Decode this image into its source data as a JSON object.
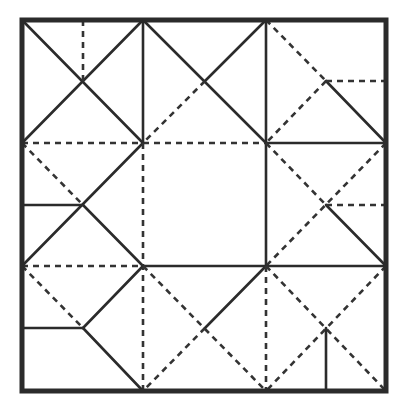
{
  "diagram": {
    "title": "",
    "colors": {
      "line": "#2b2b2b",
      "background": "#ffffff"
    },
    "border": {
      "x1": 22,
      "y1": 20,
      "x2": 386,
      "y2": 391
    },
    "grid": {
      "xs": [
        22,
        143,
        266,
        386
      ],
      "ys": [
        20,
        143,
        266,
        391
      ],
      "mid_xs": [
        83,
        205,
        326
      ],
      "mid_ys": [
        81,
        205,
        328
      ]
    },
    "lines": [
      {
        "type": "solid",
        "x1": 22,
        "y1": 20,
        "x2": 143,
        "y2": 143
      },
      {
        "type": "solid",
        "x1": 143,
        "y1": 20,
        "x2": 22,
        "y2": 143
      },
      {
        "type": "dashed",
        "x1": 83,
        "y1": 20,
        "x2": 83,
        "y2": 81
      },
      {
        "type": "solid",
        "x1": 143,
        "y1": 20,
        "x2": 143,
        "y2": 143
      },
      {
        "type": "solid",
        "x1": 143,
        "y1": 20,
        "x2": 266,
        "y2": 143
      },
      {
        "type": "solid",
        "x1": 266,
        "y1": 20,
        "x2": 205,
        "y2": 81
      },
      {
        "type": "dashed",
        "x1": 205,
        "y1": 81,
        "x2": 143,
        "y2": 143
      },
      {
        "type": "solid",
        "x1": 266,
        "y1": 20,
        "x2": 266,
        "y2": 266
      },
      {
        "type": "dashed",
        "x1": 266,
        "y1": 20,
        "x2": 326,
        "y2": 81
      },
      {
        "type": "solid",
        "x1": 326,
        "y1": 81,
        "x2": 386,
        "y2": 143
      },
      {
        "type": "dashed",
        "x1": 326,
        "y1": 81,
        "x2": 266,
        "y2": 143
      },
      {
        "type": "dashed",
        "x1": 326,
        "y1": 81,
        "x2": 386,
        "y2": 81
      },
      {
        "type": "dashed",
        "x1": 22,
        "y1": 143,
        "x2": 266,
        "y2": 143
      },
      {
        "type": "solid",
        "x1": 266,
        "y1": 143,
        "x2": 386,
        "y2": 143
      },
      {
        "type": "dashed",
        "x1": 22,
        "y1": 143,
        "x2": 83,
        "y2": 205
      },
      {
        "type": "solid",
        "x1": 143,
        "y1": 143,
        "x2": 22,
        "y2": 266
      },
      {
        "type": "solid",
        "x1": 83,
        "y1": 205,
        "x2": 143,
        "y2": 266
      },
      {
        "type": "solid",
        "x1": 22,
        "y1": 205,
        "x2": 83,
        "y2": 205
      },
      {
        "type": "dashed",
        "x1": 143,
        "y1": 143,
        "x2": 143,
        "y2": 391
      },
      {
        "type": "dashed",
        "x1": 266,
        "y1": 143,
        "x2": 326,
        "y2": 205
      },
      {
        "type": "solid",
        "x1": 326,
        "y1": 205,
        "x2": 386,
        "y2": 266
      },
      {
        "type": "dashed",
        "x1": 386,
        "y1": 143,
        "x2": 266,
        "y2": 266
      },
      {
        "type": "dashed",
        "x1": 326,
        "y1": 205,
        "x2": 386,
        "y2": 205
      },
      {
        "type": "dashed",
        "x1": 22,
        "y1": 266,
        "x2": 143,
        "y2": 266
      },
      {
        "type": "solid",
        "x1": 143,
        "y1": 266,
        "x2": 386,
        "y2": 266
      },
      {
        "type": "dashed",
        "x1": 22,
        "y1": 266,
        "x2": 83,
        "y2": 328
      },
      {
        "type": "solid",
        "x1": 83,
        "y1": 328,
        "x2": 143,
        "y2": 266
      },
      {
        "type": "solid",
        "x1": 22,
        "y1": 328,
        "x2": 83,
        "y2": 328
      },
      {
        "type": "solid",
        "x1": 83,
        "y1": 328,
        "x2": 143,
        "y2": 391
      },
      {
        "type": "dashed",
        "x1": 143,
        "y1": 266,
        "x2": 266,
        "y2": 391
      },
      {
        "type": "solid",
        "x1": 266,
        "y1": 266,
        "x2": 205,
        "y2": 328
      },
      {
        "type": "dashed",
        "x1": 205,
        "y1": 328,
        "x2": 143,
        "y2": 391
      },
      {
        "type": "dashed",
        "x1": 266,
        "y1": 266,
        "x2": 266,
        "y2": 391
      },
      {
        "type": "dashed",
        "x1": 266,
        "y1": 266,
        "x2": 386,
        "y2": 391
      },
      {
        "type": "dashed",
        "x1": 386,
        "y1": 266,
        "x2": 266,
        "y2": 391
      },
      {
        "type": "solid",
        "x1": 326,
        "y1": 328,
        "x2": 326,
        "y2": 391
      }
    ]
  }
}
